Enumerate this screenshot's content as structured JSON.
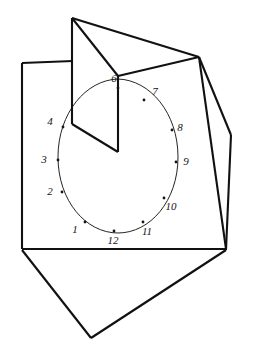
{
  "figure": {
    "background_color": "#ffffff",
    "ink_color": "#111111",
    "line_color_dial": "#242424",
    "label_color": "#151515"
  },
  "dial": {
    "center_x": 117,
    "center_y": 157,
    "radius_x": 58,
    "radius_y": 78,
    "hours": [
      {
        "label": "1",
        "dot_x": 85,
        "dot_y": 222,
        "text_x": 75,
        "text_y": 230
      },
      {
        "label": "2",
        "dot_x": 62,
        "dot_y": 192,
        "text_x": 50,
        "text_y": 192
      },
      {
        "label": "3",
        "dot_x": 58,
        "dot_y": 160,
        "text_x": 44,
        "text_y": 160
      },
      {
        "label": "4",
        "dot_x": 63,
        "dot_y": 127,
        "text_x": 50,
        "text_y": 122
      },
      {
        "label": "6",
        "dot_x": 118,
        "dot_y": 88,
        "text_x": 114,
        "text_y": 79
      },
      {
        "label": "7",
        "dot_x": 144,
        "dot_y": 100,
        "text_x": 155,
        "text_y": 92
      },
      {
        "label": "8",
        "dot_x": 172,
        "dot_y": 130,
        "text_x": 180,
        "text_y": 128
      },
      {
        "label": "9",
        "dot_x": 176,
        "dot_y": 162,
        "text_x": 186,
        "text_y": 162
      },
      {
        "label": "10",
        "dot_x": 164,
        "dot_y": 198,
        "text_x": 171,
        "text_y": 207
      },
      {
        "label": "11",
        "dot_x": 143,
        "dot_y": 222,
        "text_x": 147,
        "text_y": 232
      },
      {
        "label": "12",
        "dot_x": 114,
        "dot_y": 231,
        "text_x": 113,
        "text_y": 241
      }
    ],
    "hidden_hour_note": "5"
  },
  "geometry": {
    "base_sheet": "22,63 115,56 224,60 225,248 68,253",
    "base_sheet_left_edge": "22,63 22,248",
    "base_sheet_bottom_edge": "22,248 225,248",
    "base_sheet_top_edge": "22,63 198,57",
    "base_sheet_right_edge": "198,57 225,248",
    "right_wing": "198,57 248,135 224,250",
    "bottom_wing": "22,248 90,338 225,249",
    "gnomon_flap": "73,18 73,124 118,152 118,76",
    "gnomon_ridge_to_corner": "73,18 198,57",
    "gnomon_fold_vertical": "118,76 118,152",
    "gnomon_left_vertical": "73,18 73,124",
    "gnomon_top_slope": "73,18 118,76",
    "gnomon_bottom_slope": "73,124 118,152"
  }
}
